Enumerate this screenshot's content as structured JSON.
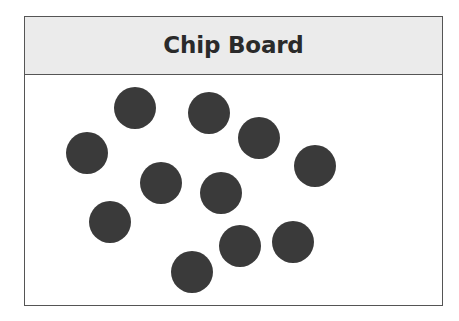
{
  "panel": {
    "title": "Chip Board",
    "header_background": "#ebebeb",
    "border_color": "#555555",
    "body_background": "#ffffff",
    "frame": {
      "x": 24,
      "y": 16,
      "width": 419,
      "height": 290
    },
    "header_height": 57
  },
  "page": {
    "background": "#ffffff",
    "width": 459,
    "height": 321
  },
  "chart_data": {
    "type": "scatter",
    "title": "Chip Board",
    "xlabel": "",
    "ylabel": "",
    "count": 11,
    "marker": {
      "shape": "circle",
      "color": "#3a3a3a",
      "radius": 21
    },
    "xlim": [
      24,
      443
    ],
    "ylim": [
      74,
      306
    ],
    "grid": false,
    "legend": null,
    "points": [
      {
        "id": "chip-1",
        "cx": 135,
        "cy": 107,
        "r": 21
      },
      {
        "id": "chip-2",
        "cx": 209,
        "cy": 112,
        "r": 21
      },
      {
        "id": "chip-3",
        "cx": 259,
        "cy": 137,
        "r": 21
      },
      {
        "id": "chip-4",
        "cx": 87,
        "cy": 152,
        "r": 21
      },
      {
        "id": "chip-5",
        "cx": 315,
        "cy": 165,
        "r": 21
      },
      {
        "id": "chip-6",
        "cx": 161,
        "cy": 182,
        "r": 21
      },
      {
        "id": "chip-7",
        "cx": 221,
        "cy": 192,
        "r": 21
      },
      {
        "id": "chip-8",
        "cx": 110,
        "cy": 221,
        "r": 21
      },
      {
        "id": "chip-9",
        "cx": 240,
        "cy": 245,
        "r": 21
      },
      {
        "id": "chip-10",
        "cx": 293,
        "cy": 241,
        "r": 21
      },
      {
        "id": "chip-11",
        "cx": 192,
        "cy": 271,
        "r": 21
      }
    ]
  }
}
